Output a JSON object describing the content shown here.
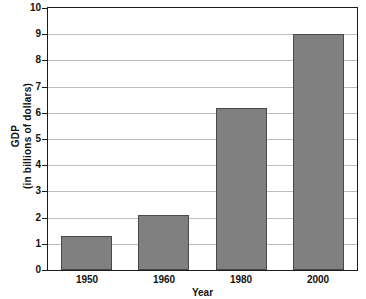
{
  "chart_data": {
    "type": "bar",
    "title": "",
    "xlabel": "Year",
    "ylabel": "GDP\n(in billions of dollars)",
    "ylabel_line1": "GDP",
    "ylabel_line2": "(in billions of dollars)",
    "categories": [
      "1950",
      "1960",
      "1980",
      "2000"
    ],
    "values": [
      1.3,
      2.1,
      6.2,
      9.0
    ],
    "series": [
      {
        "name": "GDP",
        "values": [
          1.3,
          2.1,
          6.2,
          9.0
        ]
      }
    ],
    "ylim": [
      0,
      10
    ],
    "ytick_values": [
      0,
      1,
      2,
      3,
      4,
      5,
      6,
      7,
      8,
      9,
      10
    ],
    "ytick_labels": [
      "0",
      "1",
      "2",
      "3",
      "4",
      "5",
      "6",
      "7",
      "8",
      "9",
      "10"
    ],
    "grid": true,
    "grid_axis": "y",
    "legend": false,
    "legend_position": "none",
    "bar_color": "#808080",
    "bar_border_color": "#4a4a4a",
    "grid_color": "#bdbdbd",
    "axis_color": "#1a1a1a",
    "background_color": "#ffffff",
    "text_color": "#111111"
  }
}
